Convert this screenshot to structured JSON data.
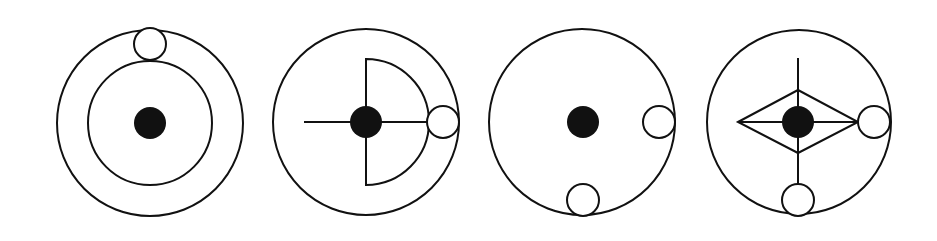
{
  "diagram": {
    "colors": {
      "stroke": "#111111",
      "fill_dot": "#111111",
      "background": "#ffffff"
    },
    "figures": [
      {
        "index": 1,
        "outer_circle": {
          "cx": 150,
          "cy": 123,
          "r": 93
        },
        "center_dot": {
          "cx": 150,
          "cy": 123,
          "r": 16
        },
        "inner_ring": {
          "cx": 150,
          "cy": 123,
          "r": 62
        },
        "small_circles": [
          {
            "cx": 150,
            "cy": 44,
            "r": 16,
            "position": "top"
          }
        ]
      },
      {
        "index": 2,
        "outer_circle": {
          "cx": 366,
          "cy": 122,
          "r": 93
        },
        "center_dot": {
          "cx": 366,
          "cy": 122,
          "r": 16
        },
        "half_circle": {
          "cx": 366,
          "cy": 122,
          "r": 63,
          "side": "right"
        },
        "horizontal_line": {
          "x1": 304,
          "x2": 427,
          "y": 122
        },
        "small_circles": [
          {
            "cx": 443,
            "cy": 122,
            "r": 16,
            "position": "right"
          }
        ]
      },
      {
        "index": 3,
        "outer_circle": {
          "cx": 582,
          "cy": 122,
          "r": 93
        },
        "center_dot": {
          "cx": 583,
          "cy": 122,
          "r": 16
        },
        "small_circles": [
          {
            "cx": 659,
            "cy": 122,
            "r": 16,
            "position": "right"
          },
          {
            "cx": 583,
            "cy": 200,
            "r": 16,
            "position": "bottom"
          }
        ]
      },
      {
        "index": 4,
        "outer_circle": {
          "cx": 799,
          "cy": 122,
          "r": 92
        },
        "center_dot": {
          "cx": 798,
          "cy": 122,
          "r": 16
        },
        "diamond": {
          "left": 738,
          "right": 858,
          "top": 90,
          "bottom": 153,
          "cx": 798,
          "cy": 122
        },
        "vertical_line": {
          "x": 798,
          "y1": 58,
          "y2": 184
        },
        "horizontal_line": {
          "x1": 738,
          "x2": 858,
          "y": 122
        },
        "small_circles": [
          {
            "cx": 874,
            "cy": 122,
            "r": 16,
            "position": "right"
          },
          {
            "cx": 798,
            "cy": 200,
            "r": 16,
            "position": "bottom"
          }
        ]
      }
    ]
  }
}
